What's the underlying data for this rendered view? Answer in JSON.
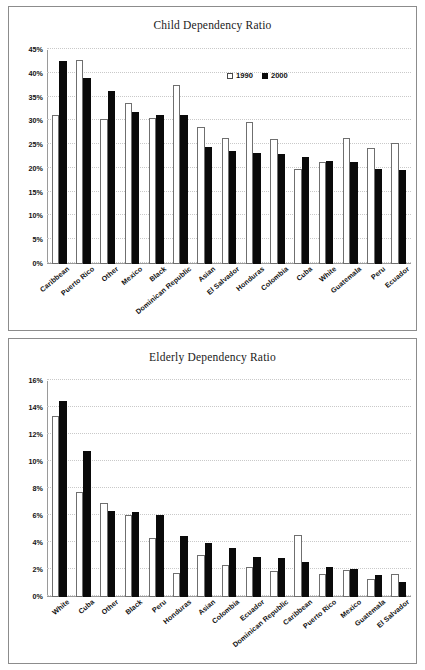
{
  "document": {
    "title": "Dependency Ratio Charts"
  },
  "legend": {
    "series_1990": "1990",
    "series_2000": "2000"
  },
  "colors": {
    "series_1990_fill": "#ffffff",
    "series_1990_border": "#6f6f6f",
    "series_2000_fill": "#0a0a0a",
    "frame_border": "#8c8c8c",
    "gridline": "#c9c9c9",
    "text": "#111111"
  },
  "chart_data": [
    {
      "id": "child-dependency-ratio",
      "type": "bar",
      "title": "Child Dependency Ratio",
      "xlabel": "",
      "ylabel": "",
      "ylim": [
        0,
        45
      ],
      "yunit": "%",
      "ytick_labels": [
        "0%",
        "5%",
        "10%",
        "15%",
        "20%",
        "25%",
        "30%",
        "35%",
        "40%",
        "45%"
      ],
      "ytick_values": [
        0,
        5,
        10,
        15,
        20,
        25,
        30,
        35,
        40,
        45
      ],
      "grid": true,
      "legend_position": "top-center",
      "categories": [
        "Caribbean",
        "Puerto Rico",
        "Other",
        "Mexico",
        "Black",
        "Dominican Republic",
        "Asian",
        "El Salvador",
        "Honduras",
        "Colombia",
        "Cuba",
        "White",
        "Guatemala",
        "Peru",
        "Ecuador"
      ],
      "series": [
        {
          "name": "1990",
          "values": [
            31.4,
            43.0,
            30.4,
            33.8,
            30.7,
            37.6,
            28.8,
            26.4,
            29.8,
            26.3,
            20.0,
            21.4,
            26.4,
            24.5,
            25.4
          ]
        },
        {
          "name": "2000",
          "values": [
            42.7,
            39.2,
            36.4,
            31.9,
            31.4,
            31.3,
            24.7,
            23.7,
            23.3,
            23.1,
            22.5,
            21.7,
            21.4,
            19.9,
            19.7
          ]
        }
      ]
    },
    {
      "id": "elderly-dependency-ratio",
      "type": "bar",
      "title": "Elderly Dependency Ratio",
      "xlabel": "",
      "ylabel": "",
      "ylim": [
        0,
        16
      ],
      "yunit": "%",
      "ytick_labels": [
        "0%",
        "2%",
        "4%",
        "6%",
        "8%",
        "10%",
        "12%",
        "14%",
        "16%"
      ],
      "ytick_values": [
        0,
        2,
        4,
        6,
        8,
        10,
        12,
        14,
        16
      ],
      "grid": true,
      "legend_position": "top-center",
      "categories": [
        "White",
        "Cuba",
        "Other",
        "Black",
        "Peru",
        "Honduras",
        "Asian",
        "Colombia",
        "Ecuador",
        "Dominican Republic",
        "Caribbean",
        "Puerto Rico",
        "Mexico",
        "Guatemala",
        "El Salvador"
      ],
      "series": [
        {
          "name": "1990",
          "values": [
            13.4,
            7.8,
            7.0,
            6.1,
            4.4,
            1.8,
            3.1,
            2.4,
            2.2,
            1.9,
            4.6,
            1.7,
            2.0,
            1.3,
            1.7
          ]
        },
        {
          "name": "2000",
          "values": [
            14.5,
            10.8,
            6.4,
            6.3,
            6.1,
            4.5,
            4.0,
            3.6,
            3.0,
            2.9,
            2.6,
            2.2,
            2.1,
            1.6,
            1.1
          ]
        }
      ]
    }
  ]
}
